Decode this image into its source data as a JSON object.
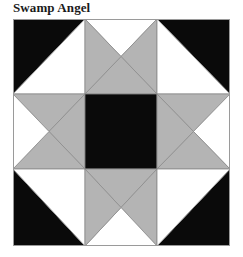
{
  "title": "Swamp Angel",
  "colors": {
    "dark": "#0a0a0a",
    "light": "#ffffff",
    "medium": "#b4b4b4",
    "seam": "#8c8c8c",
    "border": "#9a9a9a"
  },
  "block": {
    "name": "Swamp Angel",
    "grid": "3x3",
    "cells": [
      {
        "row": 0,
        "col": 0,
        "type": "half-square-triangle",
        "dark_corner": "top-left",
        "colors": [
          "dark",
          "light"
        ]
      },
      {
        "row": 0,
        "col": 1,
        "type": "quarter-square-triangle",
        "top": "light",
        "right": "medium",
        "bottom": "medium",
        "left": "medium"
      },
      {
        "row": 0,
        "col": 2,
        "type": "half-square-triangle",
        "dark_corner": "top-right",
        "colors": [
          "dark",
          "light"
        ]
      },
      {
        "row": 1,
        "col": 0,
        "type": "quarter-square-triangle",
        "top": "medium",
        "right": "medium",
        "bottom": "medium",
        "left": "light"
      },
      {
        "row": 1,
        "col": 1,
        "type": "solid-square",
        "color": "dark"
      },
      {
        "row": 1,
        "col": 2,
        "type": "quarter-square-triangle",
        "top": "medium",
        "right": "light",
        "bottom": "medium",
        "left": "medium"
      },
      {
        "row": 2,
        "col": 0,
        "type": "half-square-triangle",
        "dark_corner": "bottom-left",
        "colors": [
          "dark",
          "light"
        ]
      },
      {
        "row": 2,
        "col": 1,
        "type": "quarter-square-triangle",
        "top": "medium",
        "right": "medium",
        "bottom": "light",
        "left": "medium"
      },
      {
        "row": 2,
        "col": 2,
        "type": "half-square-triangle",
        "dark_corner": "bottom-right",
        "colors": [
          "dark",
          "light"
        ]
      }
    ]
  }
}
